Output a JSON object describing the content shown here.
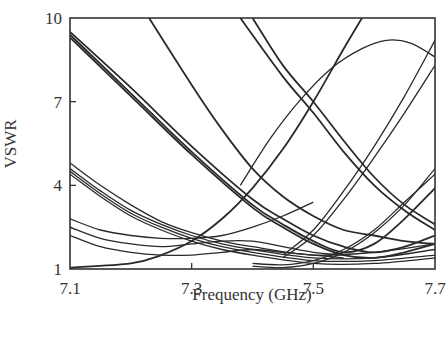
{
  "chart_data": {
    "type": "line",
    "title": "",
    "xlabel": "Frequency (GHz)",
    "ylabel": "VSWR",
    "xlim": [
      7.1,
      7.7
    ],
    "ylim": [
      1,
      10
    ],
    "xticks": [
      7.1,
      7.3,
      7.5,
      7.7
    ],
    "xtick_labels": [
      "7.1",
      "7.3",
      "7.5",
      "7.7"
    ],
    "yticks": [
      1,
      4,
      7,
      10
    ],
    "ytick_labels": [
      "1",
      "4",
      "7",
      "10"
    ],
    "grid": false,
    "legend": null,
    "line_color": "#2a2a2a",
    "series": [
      {
        "name": "curve-a1",
        "x": [
          7.1,
          7.2,
          7.3,
          7.4,
          7.45,
          7.5,
          7.55,
          7.6,
          7.65,
          7.7
        ],
        "values": [
          9.4,
          7.3,
          5.2,
          3.3,
          2.6,
          2.0,
          1.6,
          1.9,
          2.8,
          3.9
        ]
      },
      {
        "name": "curve-a2",
        "x": [
          7.1,
          7.2,
          7.3,
          7.4,
          7.45,
          7.5,
          7.55,
          7.6,
          7.65,
          7.7
        ],
        "values": [
          9.5,
          7.5,
          5.4,
          3.5,
          2.8,
          2.2,
          1.8,
          1.6,
          1.8,
          2.2
        ]
      },
      {
        "name": "curve-a3",
        "x": [
          7.1,
          7.2,
          7.3,
          7.4,
          7.45,
          7.5,
          7.55,
          7.6,
          7.65,
          7.7
        ],
        "values": [
          9.3,
          7.2,
          5.1,
          3.2,
          2.5,
          1.9,
          1.5,
          1.4,
          1.6,
          1.9
        ]
      },
      {
        "name": "curve-b1",
        "x": [
          7.1,
          7.15,
          7.2,
          7.25,
          7.3,
          7.35,
          7.4,
          7.5,
          7.6,
          7.7
        ],
        "values": [
          4.8,
          4.0,
          3.3,
          2.7,
          2.3,
          2.0,
          1.8,
          1.5,
          1.6,
          1.9
        ]
      },
      {
        "name": "curve-b2",
        "x": [
          7.1,
          7.15,
          7.2,
          7.25,
          7.3,
          7.35,
          7.4,
          7.5,
          7.6,
          7.7
        ],
        "values": [
          4.6,
          3.8,
          3.1,
          2.6,
          2.2,
          1.9,
          1.7,
          1.4,
          1.4,
          1.7
        ]
      },
      {
        "name": "curve-b3",
        "x": [
          7.1,
          7.15,
          7.2,
          7.25,
          7.3,
          7.35,
          7.4,
          7.5,
          7.6,
          7.7
        ],
        "values": [
          4.5,
          3.7,
          3.0,
          2.5,
          2.1,
          1.8,
          1.6,
          1.3,
          1.3,
          1.5
        ]
      },
      {
        "name": "curve-b4",
        "x": [
          7.1,
          7.15,
          7.2,
          7.25,
          7.3,
          7.35,
          7.4,
          7.5,
          7.6,
          7.7
        ],
        "values": [
          4.4,
          3.6,
          2.9,
          2.4,
          2.0,
          1.7,
          1.5,
          1.2,
          1.2,
          1.4
        ]
      },
      {
        "name": "curve-c1",
        "x": [
          7.1,
          7.15,
          7.2,
          7.25,
          7.3,
          7.35,
          7.4,
          7.45,
          7.5
        ],
        "values": [
          2.8,
          2.4,
          2.2,
          2.1,
          2.1,
          2.2,
          2.5,
          2.9,
          3.4
        ]
      },
      {
        "name": "curve-c2",
        "x": [
          7.1,
          7.15,
          7.2,
          7.25,
          7.3,
          7.35,
          7.4,
          7.45,
          7.5,
          7.55
        ],
        "values": [
          2.5,
          2.1,
          1.9,
          1.8,
          1.9,
          2.0,
          2.0,
          1.8,
          1.6,
          1.5
        ]
      },
      {
        "name": "curve-c3",
        "x": [
          7.1,
          7.15,
          7.2,
          7.25,
          7.3,
          7.35,
          7.4,
          7.45,
          7.5,
          7.55
        ],
        "values": [
          2.2,
          1.8,
          1.6,
          1.5,
          1.5,
          1.6,
          1.7,
          1.6,
          1.5,
          1.4
        ]
      },
      {
        "name": "curve-steep-left",
        "x": [
          7.23,
          7.3,
          7.35,
          7.4,
          7.45,
          7.5,
          7.55,
          7.6,
          7.65,
          7.7
        ],
        "values": [
          10,
          7.6,
          6.0,
          4.6,
          3.6,
          2.9,
          2.4,
          2.2,
          2.0,
          1.9
        ]
      },
      {
        "name": "curve-steep-mid1",
        "x": [
          7.38,
          7.45,
          7.5,
          7.55,
          7.6,
          7.65,
          7.7
        ],
        "values": [
          10,
          7.9,
          6.6,
          5.2,
          4.0,
          3.1,
          2.4
        ]
      },
      {
        "name": "curve-steep-mid2",
        "x": [
          7.4,
          7.45,
          7.5,
          7.55,
          7.6,
          7.65,
          7.7
        ],
        "values": [
          10,
          8.3,
          7.0,
          5.6,
          4.3,
          3.3,
          2.6
        ]
      },
      {
        "name": "curve-rising",
        "x": [
          7.1,
          7.2,
          7.25,
          7.3,
          7.35,
          7.4,
          7.45,
          7.5,
          7.55,
          7.58
        ],
        "values": [
          1.05,
          1.2,
          1.5,
          2.0,
          2.8,
          3.9,
          5.3,
          7.0,
          8.9,
          10
        ]
      },
      {
        "name": "curve-hump",
        "x": [
          7.38,
          7.43,
          7.48,
          7.53,
          7.58,
          7.62,
          7.66,
          7.7
        ],
        "values": [
          4.0,
          5.7,
          7.1,
          8.2,
          8.9,
          9.2,
          9.1,
          8.6
        ]
      },
      {
        "name": "curve-right-rise1",
        "x": [
          7.45,
          7.5,
          7.55,
          7.6,
          7.65,
          7.7
        ],
        "values": [
          1.5,
          2.4,
          3.8,
          5.4,
          7.2,
          9.2
        ]
      },
      {
        "name": "curve-right-rise2",
        "x": [
          7.45,
          7.5,
          7.55,
          7.6,
          7.65,
          7.7
        ],
        "values": [
          1.4,
          2.2,
          3.5,
          5.0,
          6.6,
          8.3
        ]
      },
      {
        "name": "curve-right-low1",
        "x": [
          7.4,
          7.45,
          7.5,
          7.55,
          7.6,
          7.65,
          7.7
        ],
        "values": [
          1.1,
          1.05,
          1.2,
          1.6,
          2.3,
          3.3,
          4.6
        ]
      },
      {
        "name": "curve-right-low2",
        "x": [
          7.4,
          7.45,
          7.5,
          7.55,
          7.6,
          7.65,
          7.7
        ],
        "values": [
          1.2,
          1.15,
          1.3,
          1.7,
          2.4,
          3.4,
          4.4
        ]
      }
    ]
  }
}
